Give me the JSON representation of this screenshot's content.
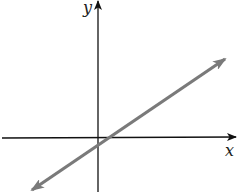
{
  "diagram": {
    "type": "coordinate-plane-line",
    "axes": {
      "x_label": "x",
      "y_label": "y",
      "color": "#111111"
    },
    "line": {
      "description": "straight line with positive slope, arrows at both ends, y-intercept slightly below origin, x-intercept slightly right of origin",
      "color": "#7a7a7a",
      "slope_sign": "positive",
      "y_intercept_sign": "negative",
      "x_intercept_sign": "positive"
    }
  }
}
